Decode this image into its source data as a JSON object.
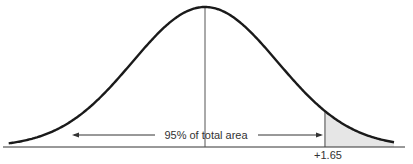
{
  "chart_data": {
    "type": "area",
    "title": "",
    "distribution": "standard normal",
    "mean": 0,
    "sd": 1,
    "x_range": [
      -2.7,
      2.6
    ],
    "critical_value": 1.65,
    "critical_label": "+1.65",
    "shaded_region": {
      "from": 1.65,
      "to": 2.6,
      "tail": "upper",
      "area": 0.05
    },
    "annotation": "95% of total area",
    "annotation_span": {
      "from": -2.7,
      "to": 1.65
    },
    "xlabel": "",
    "ylabel": "",
    "grid": false,
    "legend": null
  },
  "colors": {
    "curve": "#1a1a1a",
    "shade": "#e6e6e6",
    "axis": "#333333",
    "text": "#333333"
  }
}
